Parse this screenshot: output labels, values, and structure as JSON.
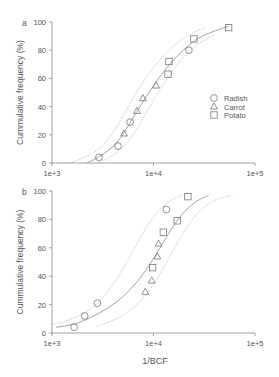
{
  "figure": {
    "xlabel": "1/BCF",
    "colors": {
      "axis": "#888888",
      "text": "#555555",
      "line": "#999999",
      "marker": "#777777"
    }
  },
  "chart_data": [
    {
      "type": "scatter",
      "panel_label": "a",
      "title": "",
      "xlabel": "",
      "ylabel": "Cummulative frequency (%)",
      "xscale": "log",
      "xlim": [
        1000,
        100000
      ],
      "ylim": [
        0,
        100
      ],
      "xticks": [
        "1e+3",
        "1e+4",
        "1e+5"
      ],
      "yticks": [
        "0",
        "20",
        "40",
        "60",
        "80",
        "100"
      ],
      "grid": false,
      "legend": {
        "position": "center-right",
        "entries": [
          {
            "label": "Radish",
            "marker": "circle"
          },
          {
            "label": "Carrot",
            "marker": "triangle"
          },
          {
            "label": "Potato",
            "marker": "square"
          }
        ]
      },
      "series": [
        {
          "name": "Radish",
          "marker": "circle",
          "points": [
            [
              2900,
              4
            ],
            [
              4470,
              12
            ],
            [
              5880,
              29
            ],
            [
              22300,
              80
            ]
          ]
        },
        {
          "name": "Carrot",
          "marker": "triangle",
          "points": [
            [
              5120,
              21
            ],
            [
              6870,
              37
            ],
            [
              7870,
              46
            ],
            [
              10600,
              55
            ]
          ]
        },
        {
          "name": "Potato",
          "marker": "square",
          "points": [
            [
              13900,
              63
            ],
            [
              14200,
              72
            ],
            [
              25000,
              88
            ],
            [
              55000,
              96
            ]
          ]
        }
      ],
      "curves": [
        {
          "name": "fit",
          "style": "solid",
          "points": [
            [
              2200,
              0
            ],
            [
              2900,
              4
            ],
            [
              4470,
              14
            ],
            [
              6870,
              37
            ],
            [
              10000,
              55
            ],
            [
              14200,
              70
            ],
            [
              22300,
              84
            ],
            [
              31000,
              91
            ],
            [
              55000,
              97
            ]
          ]
        },
        {
          "name": "upper-bound",
          "style": "dotted",
          "points": [
            [
              1500,
              0
            ],
            [
              2500,
              6
            ],
            [
              3500,
              15
            ],
            [
              5000,
              33
            ],
            [
              7000,
              52
            ],
            [
              10000,
              68
            ],
            [
              15000,
              82
            ],
            [
              22000,
              91
            ],
            [
              32000,
              96
            ]
          ]
        },
        {
          "name": "lower-bound",
          "style": "dotted",
          "points": [
            [
              2850,
              0
            ],
            [
              4200,
              6
            ],
            [
              6000,
              17
            ],
            [
              8500,
              36
            ],
            [
              12000,
              54
            ],
            [
              17000,
              70
            ],
            [
              25000,
              83
            ],
            [
              40000,
              91
            ]
          ]
        }
      ]
    },
    {
      "type": "scatter",
      "panel_label": "b",
      "title": "",
      "xlabel": "1/BCF",
      "ylabel": "Cummulative frequency (%)",
      "xscale": "log",
      "xlim": [
        1000,
        100000
      ],
      "ylim": [
        0,
        100
      ],
      "xticks": [
        "1e+3",
        "1e+4",
        "1e+5"
      ],
      "yticks": [
        "0",
        "20",
        "40",
        "60",
        "80",
        "100"
      ],
      "grid": false,
      "series": [
        {
          "name": "Radish",
          "marker": "circle",
          "points": [
            [
              1650,
              4
            ],
            [
              2100,
              12
            ],
            [
              2800,
              21
            ],
            [
              13400,
              87
            ]
          ]
        },
        {
          "name": "Carrot",
          "marker": "triangle",
          "points": [
            [
              8300,
              29
            ],
            [
              9600,
              37
            ],
            [
              10900,
              54
            ],
            [
              11200,
              63
            ]
          ]
        },
        {
          "name": "Potato",
          "marker": "square",
          "points": [
            [
              9800,
              46
            ],
            [
              12500,
              71
            ],
            [
              17100,
              79
            ],
            [
              21800,
              96
            ]
          ]
        }
      ],
      "curves": [
        {
          "name": "fit",
          "style": "solid",
          "points": [
            [
              1100,
              4
            ],
            [
              1700,
              6
            ],
            [
              2800,
              13
            ],
            [
              4500,
              22
            ],
            [
              7000,
              36
            ],
            [
              10000,
              52
            ],
            [
              14000,
              70
            ],
            [
              19000,
              84
            ],
            [
              26000,
              93
            ],
            [
              35000,
              97
            ]
          ]
        },
        {
          "name": "upper-bound",
          "style": "dotted",
          "points": [
            [
              1000,
              6
            ],
            [
              1500,
              9
            ],
            [
              2500,
              17
            ],
            [
              4000,
              33
            ],
            [
              6000,
              55
            ],
            [
              8500,
              75
            ],
            [
              12000,
              89
            ],
            [
              17000,
              96
            ],
            [
              22000,
              99
            ]
          ]
        },
        {
          "name": "lower-bound",
          "style": "dotted",
          "points": [
            [
              2800,
              5
            ],
            [
              4500,
              10
            ],
            [
              7000,
              20
            ],
            [
              10000,
              33
            ],
            [
              14000,
              52
            ],
            [
              20000,
              72
            ],
            [
              28000,
              86
            ],
            [
              40000,
              94
            ],
            [
              60000,
              97
            ]
          ]
        }
      ]
    }
  ]
}
